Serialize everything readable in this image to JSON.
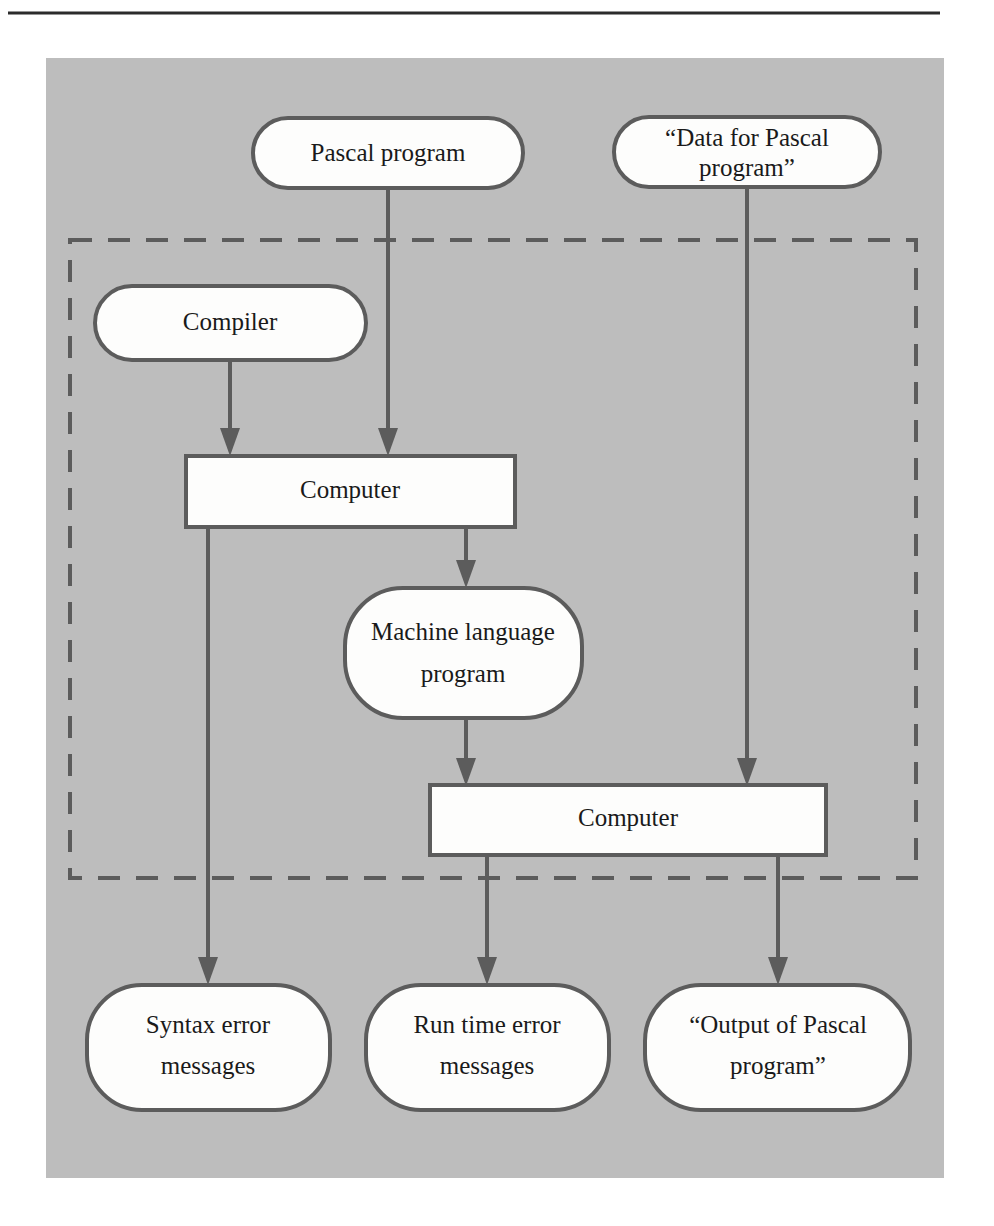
{
  "figure": {
    "kind": "flowchart",
    "panel_color": "#bdbdbd",
    "line_color": "#5c5c5c",
    "node_fill": "#fdfdfc",
    "rule_color": "#2b2b2b"
  },
  "nodes": {
    "pascal_program": {
      "label": "Pascal program",
      "shape": "stadium"
    },
    "data_for_pascal": {
      "line1": "“Data for Pascal",
      "line2": "program”",
      "shape": "stadium"
    },
    "compiler": {
      "label": "Compiler",
      "shape": "stadium"
    },
    "computer_compile": {
      "label": "Computer",
      "shape": "rectangle"
    },
    "machine_language": {
      "line1": "Machine language",
      "line2": "program",
      "shape": "stadium"
    },
    "computer_run": {
      "label": "Computer",
      "shape": "rectangle"
    },
    "syntax_errors": {
      "line1": "Syntax error",
      "line2": "messages",
      "shape": "rounded"
    },
    "runtime_errors": {
      "line1": "Run time error",
      "line2": "messages",
      "shape": "rounded"
    },
    "output_of_pascal": {
      "line1": "“Output of Pascal",
      "line2": "program”",
      "shape": "rounded"
    }
  },
  "edges": [
    {
      "from": "pascal_program",
      "to": "computer_compile"
    },
    {
      "from": "data_for_pascal",
      "to": "computer_run"
    },
    {
      "from": "compiler",
      "to": "computer_compile"
    },
    {
      "from": "computer_compile",
      "to": "syntax_errors"
    },
    {
      "from": "computer_compile",
      "to": "machine_language"
    },
    {
      "from": "machine_language",
      "to": "computer_run"
    },
    {
      "from": "computer_run",
      "to": "runtime_errors"
    },
    {
      "from": "computer_run",
      "to": "output_of_pascal"
    }
  ]
}
